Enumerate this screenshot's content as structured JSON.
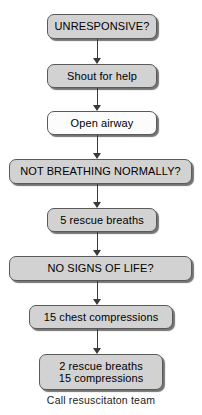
{
  "diagram": {
    "background_color": "#ffffff",
    "box_fill_gray": "#d2d2d2",
    "box_fill_white": "#fcfcfc",
    "box_border_color": "#5a5a5a",
    "connector_color": "#3a3a3a",
    "text_color": "#000000"
  },
  "nodes": [
    {
      "id": "unresponsive",
      "label": "UNRESPONSIVE?",
      "fill": "gray",
      "emphasis": "question",
      "font_size": 11,
      "x": 47,
      "y": 14,
      "width": 110,
      "height": 25
    },
    {
      "id": "shout-for-help",
      "label": "Shout for help",
      "fill": "gray",
      "emphasis": "action",
      "font_size": 11,
      "x": 47,
      "y": 64,
      "width": 110,
      "height": 24
    },
    {
      "id": "open-airway",
      "label": "Open airway",
      "fill": "white",
      "emphasis": "action",
      "font_size": 11,
      "x": 47,
      "y": 111,
      "width": 110,
      "height": 24
    },
    {
      "id": "not-breathing-normally",
      "label": "NOT BREATHING NORMALLY?",
      "fill": "gray",
      "emphasis": "question",
      "font_size": 11,
      "x": 9,
      "y": 159,
      "width": 183,
      "height": 25
    },
    {
      "id": "five-rescue-breaths",
      "label": "5 rescue breaths",
      "fill": "gray",
      "emphasis": "action",
      "font_size": 11,
      "x": 47,
      "y": 208,
      "width": 110,
      "height": 24
    },
    {
      "id": "no-signs-of-life",
      "label": "NO SIGNS OF LIFE?",
      "fill": "gray",
      "emphasis": "question",
      "font_size": 11,
      "x": 9,
      "y": 256,
      "width": 183,
      "height": 25
    },
    {
      "id": "fifteen-chest-compressions",
      "label": "15 chest compressions",
      "fill": "gray",
      "emphasis": "action",
      "font_size": 11,
      "x": 29,
      "y": 305,
      "width": 144,
      "height": 24
    },
    {
      "id": "two-breaths-fifteen-compressions",
      "label_line1": "2 rescue breaths",
      "label_line2": "15 compressions",
      "fill": "gray",
      "emphasis": "action",
      "font_size": 11,
      "x": 39,
      "y": 354,
      "width": 124,
      "height": 36
    }
  ],
  "connectors": [
    {
      "id": "arrow-unresponsive-to-shout",
      "from": "unresponsive",
      "to": "shout-for-help",
      "x": 97,
      "y": 39,
      "length": 25
    },
    {
      "id": "arrow-shout-to-open-airway",
      "from": "shout-for-help",
      "to": "open-airway",
      "x": 97,
      "y": 88,
      "length": 23
    },
    {
      "id": "arrow-open-airway-to-not-breathing",
      "from": "open-airway",
      "to": "not-breathing-normally",
      "x": 97,
      "y": 135,
      "length": 24
    },
    {
      "id": "arrow-not-breathing-to-rescue-breaths",
      "from": "not-breathing-normally",
      "to": "five-rescue-breaths",
      "x": 97,
      "y": 184,
      "length": 24
    },
    {
      "id": "arrow-rescue-breaths-to-no-signs",
      "from": "five-rescue-breaths",
      "to": "no-signs-of-life",
      "x": 97,
      "y": 232,
      "length": 24
    },
    {
      "id": "arrow-no-signs-to-chest-compressions",
      "from": "no-signs-of-life",
      "to": "fifteen-chest-compressions",
      "x": 97,
      "y": 281,
      "length": 24
    },
    {
      "id": "arrow-compressions-to-breaths-cycle",
      "from": "fifteen-chest-compressions",
      "to": "two-breaths-fifteen-compressions",
      "x": 97,
      "y": 329,
      "length": 25
    }
  ],
  "caption": {
    "text": "Call resuscitaton team",
    "y": 394
  }
}
